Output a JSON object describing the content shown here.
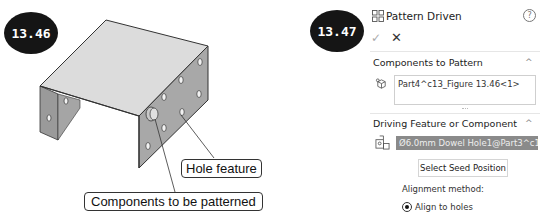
{
  "figures": {
    "left_badge": "13.46",
    "right_badge": "13.47"
  },
  "callouts": {
    "hole_feature": "Hole feature",
    "components": "Components to be patterned"
  },
  "property_manager": {
    "title": "Pattern Driven",
    "icon": "pattern-driven-icon",
    "help_glyph": "?",
    "ok_glyph": "✓",
    "cancel_glyph": "✕",
    "sections": {
      "components": {
        "title": "Components to Pattern",
        "collapse_glyph": "^",
        "items": [
          "Part4^c13_Figure 13.46<1>"
        ]
      },
      "driving": {
        "title": "Driving Feature or Component",
        "collapse_glyph": "^",
        "selected_value": "Ø6.0mm Dowel Hole1@Part3^c13_F",
        "seed_button": "Select Seed Position",
        "alignment_label": "Alignment method:",
        "alignment_option": "Align to holes"
      }
    }
  },
  "colors": {
    "badge_bg": "#151515",
    "selection_bg": "#8a8a8a",
    "plate_face": "#d9d9d9",
    "plate_side": "#9a9a9a"
  }
}
